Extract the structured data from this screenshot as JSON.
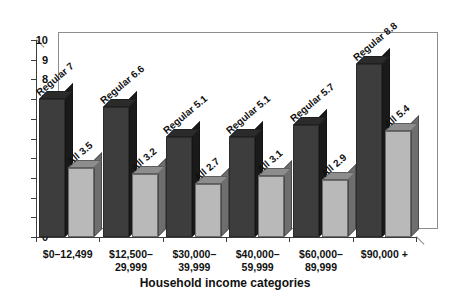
{
  "chart_data": {
    "type": "bar",
    "title": "",
    "subtitle": "",
    "xlabel": "Household income categories",
    "ylabel": "",
    "ylim": [
      0,
      10
    ],
    "ytick_step": 1,
    "grid": false,
    "legend_position": "none",
    "style": "3d-clustered-column",
    "categories": [
      "$0–12,499",
      "$12,500–\n29,999",
      "$30,000–\n39,999",
      "$40,000–\n59,999",
      "$60,000–\n89,999",
      "$90,000 +"
    ],
    "ytick_labels": [
      "0",
      "1",
      "2",
      "3",
      "4",
      "5",
      "6",
      "7",
      "8",
      "9",
      "10"
    ],
    "series": [
      {
        "name": "Regular",
        "color": "#3d3d3d",
        "values": [
          7,
          6.6,
          5.1,
          5.1,
          5.7,
          8.8
        ],
        "point_labels": [
          "Regular 7",
          "Regular 6.6",
          "Regular 5.1",
          "Regular 5.1",
          "Regular 5.7",
          "Regular 8.8"
        ]
      },
      {
        "name": "All",
        "color": "#b9b9b9",
        "values": [
          3.5,
          3.2,
          2.7,
          3.1,
          2.9,
          5.4
        ],
        "point_labels": [
          "All 3.5",
          "All 3.2",
          "All 2.7",
          "All 3.1",
          "All 2.9",
          "All 5.4"
        ]
      }
    ]
  }
}
